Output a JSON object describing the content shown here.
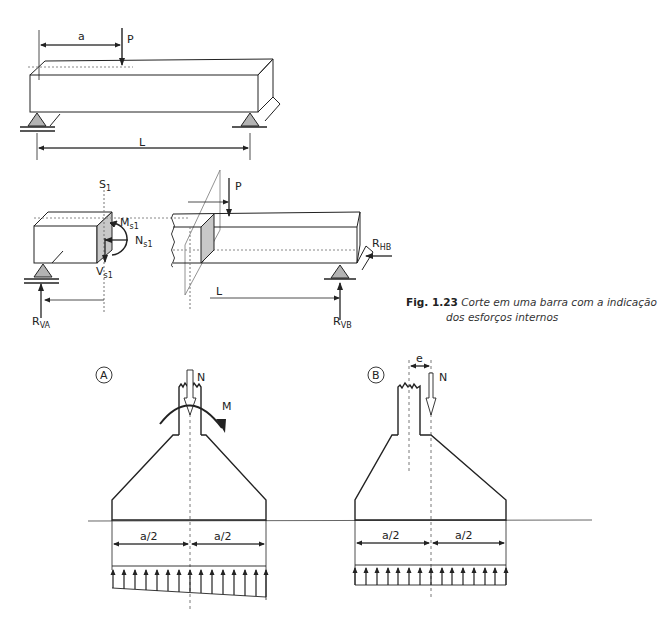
{
  "figure": {
    "number": "Fig. 1.23",
    "caption_line1": "Corte em uma barra com a indicação",
    "caption_line2": "dos esforços internos"
  },
  "beam_top": {
    "labels": {
      "distance_a": "a",
      "load": "P",
      "span": "L"
    }
  },
  "beam_cut": {
    "labels": {
      "section": "S",
      "section_sub": "1",
      "moment": "M",
      "moment_sub": "s1",
      "normal": "N",
      "normal_sub": "s1",
      "shear": "V",
      "shear_sub": "s1",
      "reaction_va": "R",
      "reaction_va_sub": "VA",
      "reaction_vb": "R",
      "reaction_vb_sub": "VB",
      "reaction_hb": "R",
      "reaction_hb_sub": "HB",
      "load": "P",
      "span": "L"
    }
  },
  "footing_a": {
    "tag": "A",
    "labels": {
      "normal": "N",
      "moment": "M",
      "half_left": "a/2",
      "half_right": "a/2"
    },
    "pressure": "trapezoidal"
  },
  "footing_b": {
    "tag": "B",
    "labels": {
      "eccentricity": "e",
      "normal": "N",
      "half_left": "a/2",
      "half_right": "a/2"
    },
    "pressure": "uniform"
  },
  "colors": {
    "line": "#222222",
    "support_fill": "#b3b3b3",
    "section_fill": "#c8c8c8",
    "dashed": "#555555"
  }
}
